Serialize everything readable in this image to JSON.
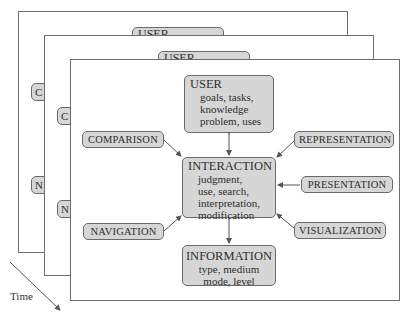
{
  "clipped_header_text": "… ……… …………………",
  "time_axis": {
    "label": "Time"
  },
  "frames": [
    {
      "id": "frame-back",
      "user_label": "USER",
      "left_labels": [
        "C",
        "N"
      ]
    },
    {
      "id": "frame-middle",
      "user_label": "USER",
      "left_labels": [
        "C",
        "N"
      ]
    },
    {
      "id": "frame-front"
    }
  ],
  "diagram": {
    "user": {
      "title": "USER",
      "lines": [
        "goals, tasks,",
        "knowledge",
        "problem, uses"
      ]
    },
    "interaction": {
      "title": "INTERACTION",
      "lines": [
        "judgment,",
        "use, search,",
        "interpretation,",
        "modification"
      ]
    },
    "information": {
      "title": "INFORMATION",
      "lines": [
        "type, medium",
        "mode, level"
      ]
    },
    "left_nodes": [
      "COMPARISON",
      "NAVIGATION"
    ],
    "right_nodes": [
      "REPRESENTATION",
      "PRESENTATION",
      "VISUALIZATION"
    ]
  },
  "colors": {
    "box_fill": "#d6d6d6",
    "box_border": "#6a6a6a",
    "frame_border": "#6e6e6e",
    "arrow": "#555555"
  }
}
